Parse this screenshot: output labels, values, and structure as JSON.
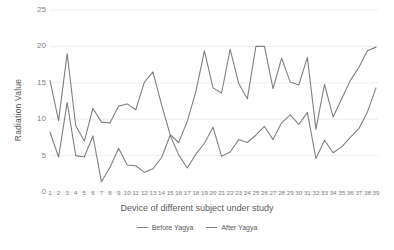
{
  "chart_data": {
    "type": "line",
    "title": "",
    "xlabel": "Device of different subject under study",
    "ylabel": "Radiation Value",
    "ylim": [
      0,
      25
    ],
    "yticks": [
      0,
      5,
      10,
      15,
      20,
      25
    ],
    "grid": true,
    "legend_position": "bottom",
    "categories": [
      "1",
      "2",
      "3",
      "4",
      "5",
      "6",
      "7",
      "8",
      "9",
      "10",
      "11",
      "12",
      "13",
      "14",
      "15",
      "16",
      "17",
      "18",
      "19",
      "20",
      "21",
      "22",
      "23",
      "24",
      "25",
      "26",
      "27",
      "28",
      "29",
      "30",
      "31",
      "32",
      "33",
      "34",
      "35",
      "36",
      "37",
      "38",
      "39"
    ],
    "series": [
      {
        "name": "Before Yagya",
        "color": "#808080",
        "values": [
          8.2,
          4.8,
          12.3,
          5.0,
          4.8,
          7.7,
          1.4,
          3.4,
          6.0,
          3.7,
          3.6,
          2.7,
          3.2,
          4.7,
          7.8,
          5.1,
          3.3,
          5.2,
          6.7,
          8.9,
          4.9,
          5.5,
          7.2,
          6.8,
          7.8,
          9.0,
          7.2,
          9.5,
          10.6,
          9.3,
          10.9,
          4.6,
          7.1,
          5.4,
          6.2,
          7.5,
          8.7,
          11.0,
          14.3
        ]
      },
      {
        "name": "After Yagya",
        "color": "#808080",
        "values": [
          15.3,
          9.8,
          19.0,
          9.1,
          7.0,
          11.5,
          9.6,
          9.5,
          11.8,
          12.1,
          11.3,
          15.1,
          16.5,
          12.0,
          7.9,
          6.8,
          9.7,
          13.8,
          19.4,
          14.3,
          13.6,
          19.6,
          14.9,
          12.8,
          20.0,
          20.0,
          14.2,
          18.4,
          15.1,
          14.7,
          18.5,
          8.6,
          14.8,
          10.3,
          12.8,
          15.3,
          17.1,
          19.4,
          19.9
        ]
      }
    ]
  },
  "axis": {
    "y_title": "Radiation Value",
    "x_title": "Device of different subject under study"
  }
}
